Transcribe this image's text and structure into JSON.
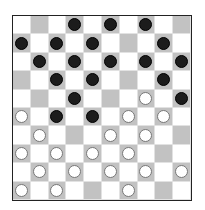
{
  "board": {
    "size": 10,
    "colors": {
      "dark_square": "#c2c2c2",
      "light_square": "#ffffff",
      "black_piece": "#1c1c1c",
      "white_piece": "#ffffff"
    },
    "rows": [
      ".  .  .  b  .  b  .  b  .  .",
      "b  .  b  .  b  .  .  .  b  .",
      ".  b  .  b  .  b  .  b  .  b",
      ".  .  b  .  b  .  .  .  b  .",
      ".  .  .  b  .  .  .  w  .  b",
      "w  .  b  .  b  .  w  .  w  .",
      ".  w  .  .  .  w  .  w  .  .",
      "w  .  w  .  w  .  w  .  .  .",
      ".  w  .  w  .  w  .  w  .  w",
      "w  .  w  .  .  .  w  .  .  ."
    ],
    "pieces": {
      "black": [
        [
          0,
          3
        ],
        [
          0,
          5
        ],
        [
          0,
          7
        ],
        [
          1,
          0
        ],
        [
          1,
          2
        ],
        [
          1,
          4
        ],
        [
          1,
          8
        ],
        [
          2,
          1
        ],
        [
          2,
          3
        ],
        [
          2,
          5
        ],
        [
          2,
          7
        ],
        [
          2,
          9
        ],
        [
          3,
          2
        ],
        [
          3,
          4
        ],
        [
          3,
          8
        ],
        [
          4,
          3
        ],
        [
          4,
          9
        ],
        [
          5,
          2
        ],
        [
          5,
          4
        ]
      ],
      "white": [
        [
          4,
          7
        ],
        [
          5,
          0
        ],
        [
          5,
          6
        ],
        [
          5,
          8
        ],
        [
          6,
          1
        ],
        [
          6,
          5
        ],
        [
          6,
          7
        ],
        [
          7,
          0
        ],
        [
          7,
          2
        ],
        [
          7,
          4
        ],
        [
          7,
          6
        ],
        [
          8,
          1
        ],
        [
          8,
          3
        ],
        [
          8,
          5
        ],
        [
          8,
          7
        ],
        [
          8,
          9
        ],
        [
          9,
          0
        ],
        [
          9,
          2
        ],
        [
          9,
          6
        ]
      ]
    },
    "counts": {
      "black": 19,
      "white": 19
    }
  }
}
